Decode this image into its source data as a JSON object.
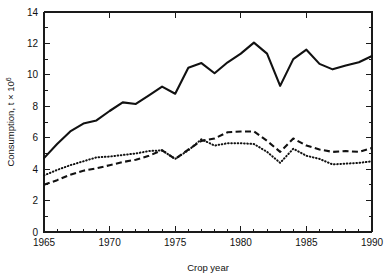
{
  "chart_data": {
    "type": "line",
    "title": "",
    "xlabel": "Crop year",
    "ylabel": "Consumption, t × 10⁶",
    "ylabel_base": "Consumption, t × 10",
    "ylabel_exp": "6",
    "xlim": [
      1965,
      1990
    ],
    "ylim": [
      0,
      14
    ],
    "grid": false,
    "legend": "none",
    "x_major_ticks": [
      1965,
      1970,
      1975,
      1980,
      1985,
      1990
    ],
    "x_major_tick_labels": [
      "1965",
      "1970",
      "1975",
      "1980",
      "1985",
      "1990"
    ],
    "x_minor_tick_step": 1,
    "y_major_ticks": [
      0,
      2,
      4,
      6,
      8,
      10,
      12,
      14
    ],
    "y_major_tick_labels": [
      "0",
      "2",
      "4",
      "6",
      "8",
      "10",
      "12",
      "14"
    ],
    "y_minor_tick_step": 1,
    "x": [
      1965,
      1966,
      1967,
      1968,
      1969,
      1970,
      1971,
      1972,
      1973,
      1974,
      1975,
      1976,
      1977,
      1978,
      1979,
      1980,
      1981,
      1982,
      1983,
      1984,
      1985,
      1986,
      1987,
      1988,
      1989,
      1990
    ],
    "series": [
      {
        "name": "solid-series",
        "style": "solid",
        "color": "#111111",
        "values": [
          4.7,
          5.6,
          6.4,
          6.9,
          7.1,
          7.7,
          8.25,
          8.15,
          8.7,
          9.25,
          8.8,
          10.45,
          10.75,
          10.1,
          10.8,
          11.35,
          12.05,
          11.35,
          9.3,
          11.0,
          11.6,
          10.7,
          10.35,
          10.6,
          10.8,
          11.2
        ]
      },
      {
        "name": "dashed-series",
        "style": "dashed",
        "color": "#111111",
        "values": [
          3.0,
          3.3,
          3.65,
          3.9,
          4.05,
          4.25,
          4.45,
          4.6,
          4.85,
          5.2,
          4.65,
          5.25,
          5.8,
          5.95,
          6.35,
          6.4,
          6.4,
          5.8,
          5.1,
          5.95,
          5.5,
          5.25,
          5.1,
          5.15,
          5.1,
          5.35
        ]
      },
      {
        "name": "dotted-series",
        "style": "dotted",
        "color": "#111111",
        "values": [
          3.6,
          3.95,
          4.25,
          4.5,
          4.75,
          4.8,
          4.9,
          5.0,
          5.15,
          5.2,
          4.65,
          5.2,
          5.9,
          5.5,
          5.65,
          5.65,
          5.6,
          5.1,
          4.4,
          5.3,
          4.85,
          4.65,
          4.3,
          4.35,
          4.4,
          4.5
        ]
      }
    ]
  }
}
